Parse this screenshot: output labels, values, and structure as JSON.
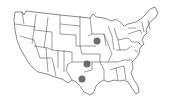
{
  "map": {
    "title": "United States map",
    "region": "Contiguous United States",
    "style": {
      "land_fill": "#ffffff",
      "border_color": "#3a3a3a",
      "marker_color": "#555555"
    },
    "markers": [
      {
        "state": "Iowa",
        "x": 97,
        "y": 41,
        "r": 3.5
      },
      {
        "state": "Oklahoma",
        "x": 87,
        "y": 64,
        "r": 3.5
      },
      {
        "state": "Texas",
        "x": 82,
        "y": 79,
        "r": 3.5
      }
    ]
  }
}
